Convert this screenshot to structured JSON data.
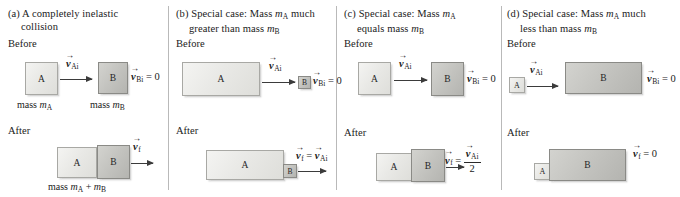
{
  "figure": {
    "phase_before": "Before",
    "phase_after": "After"
  },
  "panels": [
    {
      "id": "a",
      "caption_line1": "(a) A completely inelastic",
      "caption_line2": "collision",
      "before": {
        "phase": "Before",
        "box_a_label": "A",
        "box_b_label": "B",
        "velocity_a": "vAi",
        "velocity_b": "vBi = 0",
        "mass_a_label": "mass mA",
        "mass_b_label": "mass mB"
      },
      "after": {
        "phase": "After",
        "box_a_label": "A",
        "box_b_label": "B",
        "velocity_f": "vf",
        "mass_label": "mass mA + mB"
      }
    },
    {
      "id": "b",
      "caption_line1": "(b) Special case: Mass mA much",
      "caption_line2": "greater than mass mB",
      "before": {
        "phase": "Before",
        "box_a_label": "A",
        "box_b_label": "B",
        "velocity_a": "vAi",
        "velocity_b": "vBi = 0"
      },
      "after": {
        "phase": "After",
        "box_a_label": "A",
        "box_b_label": "B",
        "velocity_f": "vf = vAi"
      }
    },
    {
      "id": "c",
      "caption_line1": "(c) Special case: Mass mA",
      "caption_line2": "equals mass mB",
      "before": {
        "phase": "Before",
        "box_a_label": "A",
        "box_b_label": "B",
        "velocity_a": "vAi",
        "velocity_b": "vBi = 0"
      },
      "after": {
        "phase": "After",
        "box_a_label": "A",
        "box_b_label": "B",
        "velocity_f": "vf = vAi / 2",
        "fraction_numerator": "vAi",
        "fraction_denominator": "2"
      }
    },
    {
      "id": "d",
      "caption_line1": "(d) Special case: Mass mA much",
      "caption_line2": "less than mass mB",
      "before": {
        "phase": "Before",
        "box_a_label": "A",
        "box_b_label": "B",
        "velocity_a": "vAi",
        "velocity_b": "vBi = 0"
      },
      "after": {
        "phase": "After",
        "box_a_label": "A",
        "box_b_label": "B",
        "velocity_f": "vf = 0"
      }
    }
  ],
  "symbols": {
    "v": "v",
    "m": "m",
    "sub_Ai": "Ai",
    "sub_Bi": "Bi",
    "sub_f": "f",
    "sub_A": "A",
    "sub_B": "B",
    "equals_zero": "= 0",
    "equals": "=",
    "plus": "+",
    "mass_word": "mass",
    "two": "2"
  },
  "colors": {
    "box_a_fill": "#ececea",
    "box_b_fill": "#c6c6c2",
    "border": "#8d8d8d",
    "arrow": "#3b3b3b",
    "divider": "#b9b9b9",
    "text": "#1a1a1a",
    "background": "#ffffff"
  }
}
